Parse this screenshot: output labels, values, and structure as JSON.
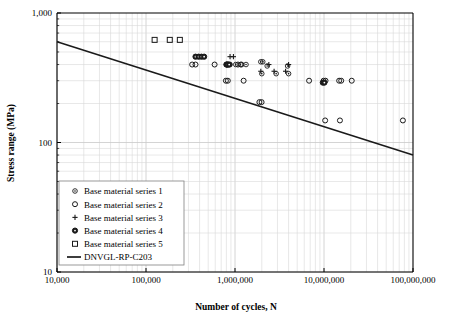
{
  "chart_data": {
    "type": "scatter",
    "title": "",
    "xlabel": "Number of cycles, N",
    "ylabel": "Stress range (MPa)",
    "xscale": "log",
    "yscale": "log",
    "xlim": [
      10000,
      100000000
    ],
    "ylim": [
      10,
      1000
    ],
    "grid": "minor-log-gridlines-both-axes",
    "legend_position": "inside-lower-left",
    "xticks": [
      "10,000",
      "100,000",
      "1,000,000",
      "10,000,000",
      "100,000,000"
    ],
    "xtick_values": [
      10000,
      100000,
      1000000,
      10000000,
      100000000
    ],
    "yticks": [
      "10",
      "100",
      "1,000"
    ],
    "ytick_values": [
      10,
      100,
      1000
    ],
    "series": [
      {
        "name": "Base material series 1",
        "marker": "small-diamond",
        "points": [
          [
            880000,
            400
          ],
          [
            1020000,
            400
          ],
          [
            1150000,
            400
          ],
          [
            1330000,
            400
          ],
          [
            2300000,
            390
          ],
          [
            3900000,
            390
          ],
          [
            2000000,
            340
          ],
          [
            2900000,
            340
          ],
          [
            4000000,
            340
          ],
          [
            1950000,
            420
          ],
          [
            2050000,
            420
          ]
        ]
      },
      {
        "name": "Base material series 2",
        "marker": "open-circle",
        "points": [
          [
            330000,
            400
          ],
          [
            360000,
            400
          ],
          [
            590000,
            400
          ],
          [
            810000,
            400
          ],
          [
            840000,
            400
          ],
          [
            1080000,
            400
          ],
          [
            1180000,
            400
          ],
          [
            790000,
            300
          ],
          [
            830000,
            300
          ],
          [
            1250000,
            300
          ],
          [
            1880000,
            205
          ],
          [
            1990000,
            205
          ],
          [
            6800000,
            300
          ],
          [
            9900000,
            300
          ],
          [
            10400000,
            300
          ],
          [
            14800000,
            300
          ],
          [
            15600000,
            300
          ],
          [
            20500000,
            300
          ],
          [
            10300000,
            148
          ],
          [
            15100000,
            148
          ],
          [
            77000000,
            148
          ]
        ]
      },
      {
        "name": "Base material series 3",
        "marker": "plus",
        "points": [
          [
            880000,
            460
          ],
          [
            960000,
            460
          ],
          [
            2400000,
            400
          ],
          [
            4000000,
            400
          ],
          [
            1950000,
            355
          ],
          [
            2750000,
            355
          ],
          [
            3700000,
            355
          ]
        ]
      },
      {
        "name": "Base material series 4",
        "marker": "filled-circle",
        "points": [
          [
            360000,
            460
          ],
          [
            390000,
            460
          ],
          [
            420000,
            460
          ],
          [
            450000,
            460
          ],
          [
            800000,
            400
          ],
          [
            820000,
            400
          ],
          [
            860000,
            400
          ],
          [
            9700000,
            290
          ],
          [
            10100000,
            290
          ]
        ]
      },
      {
        "name": "Base material series 5",
        "marker": "open-square",
        "points": [
          [
            125000,
            620
          ],
          [
            185000,
            620
          ],
          [
            240000,
            620
          ]
        ]
      }
    ],
    "lines": [
      {
        "name": "DNVGL-RP-C203",
        "style": "solid-black",
        "points": [
          [
            10000,
            600
          ],
          [
            100000000,
            80
          ]
        ]
      }
    ]
  },
  "legend": {
    "entries": [
      {
        "label": "Base material series 1",
        "marker": "small-diamond"
      },
      {
        "label": "Base material series 2",
        "marker": "open-circle"
      },
      {
        "label": "Base material series 3",
        "marker": "plus"
      },
      {
        "label": "Base material series 4",
        "marker": "filled-circle"
      },
      {
        "label": "Base material series 5",
        "marker": "open-square"
      },
      {
        "label": "DNVGL-RP-C203",
        "marker": "line"
      }
    ]
  },
  "colors": {
    "axis": "#000000",
    "gridline_minor": "#d9d9d9",
    "gridline_major": "#c9c9c9",
    "marker": "#1a1a1a",
    "curve": "#1a1a1a",
    "background": "#ffffff"
  }
}
